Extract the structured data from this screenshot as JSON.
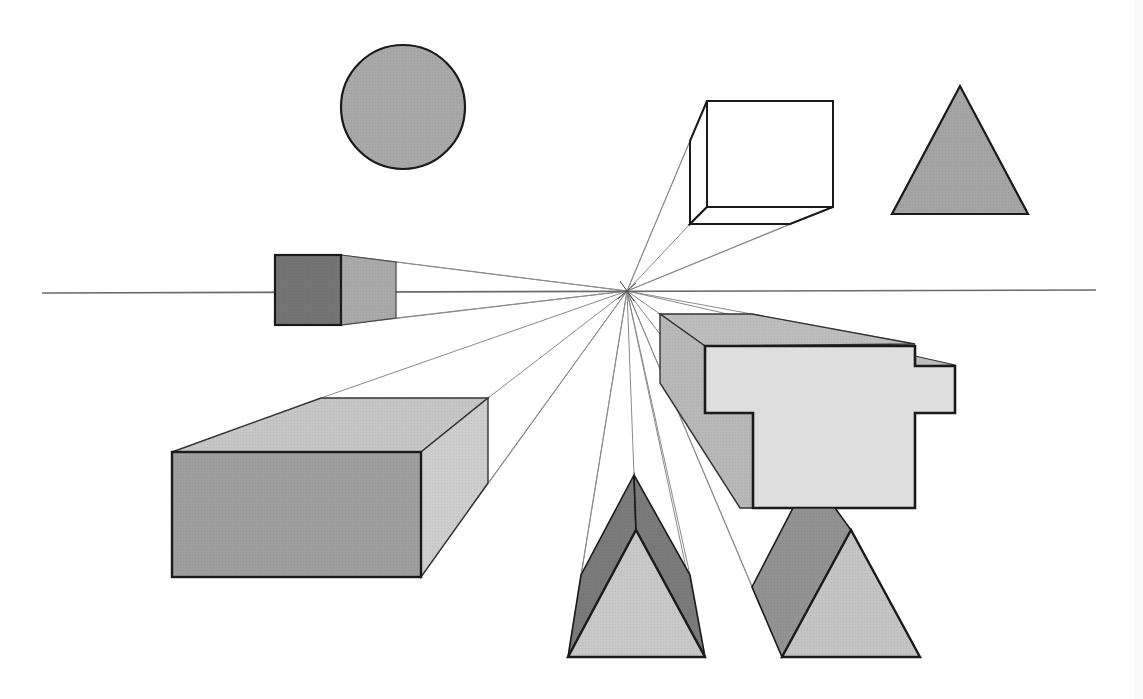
{
  "diagram": {
    "type": "one-point perspective",
    "colors": {
      "background": "#ffffff",
      "outline": "#1a1a1a",
      "ray": "#8a8a8a",
      "horizon": "#6a6a6a",
      "dark": "#777777",
      "mid": "#a8a8a8",
      "light": "#c4c4c4",
      "lighter": "#dcdcdc",
      "white": "#ffffff"
    },
    "horizon": {
      "x1": 42,
      "y1": 293,
      "x2": 1096,
      "y2": 290
    },
    "vanishing_point": {
      "x": 627,
      "y": 291
    },
    "shapes": [
      {
        "id": "circle",
        "kind": "circle",
        "cx": 403,
        "cy": 107,
        "r": 62,
        "fill": "mid"
      },
      {
        "id": "triangle",
        "kind": "polygon",
        "points": "960,86 892,214 1028,214",
        "fill": "mid"
      },
      {
        "id": "wire-box",
        "kind": "box"
      },
      {
        "id": "small-cube",
        "kind": "box"
      },
      {
        "id": "large-box",
        "kind": "box"
      },
      {
        "id": "stepped-block",
        "kind": "extrusion"
      },
      {
        "id": "left-prism",
        "kind": "prism"
      },
      {
        "id": "right-prism",
        "kind": "prism"
      }
    ],
    "rays": [
      [
        707,
        100
      ],
      [
        690,
        141
      ],
      [
        690,
        224
      ],
      [
        790,
        224
      ],
      [
        833,
        207
      ],
      [
        341,
        255
      ],
      [
        396,
        262
      ],
      [
        396,
        318
      ],
      [
        341,
        325
      ],
      [
        321,
        398
      ],
      [
        488,
        398
      ],
      [
        488,
        483
      ],
      [
        421,
        577
      ],
      [
        660,
        314
      ],
      [
        915,
        344
      ],
      [
        955,
        366
      ],
      [
        634,
        475
      ],
      [
        581,
        575
      ],
      [
        690,
        575
      ],
      [
        568,
        657
      ],
      [
        705,
        657
      ],
      [
        752,
        587
      ],
      [
        782,
        657
      ],
      [
        793,
        508
      ]
    ]
  }
}
